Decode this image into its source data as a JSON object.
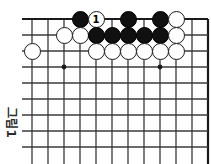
{
  "figure": {
    "caption": "그림1",
    "kind": "go-board-diagram"
  },
  "board": {
    "background_color": "#ffffff",
    "line_color": "#3a3a3a",
    "edge_color": "#1a1a1a",
    "columns": 12,
    "rows": 9,
    "spacing_px": 16,
    "origin_x": 32,
    "origin_y": 19,
    "right_edge_bold": true,
    "star_points": [
      {
        "col": 2,
        "row": 3
      },
      {
        "col": 8,
        "row": 3
      }
    ]
  },
  "stones": [
    {
      "id": "s1",
      "color": "black",
      "col": 3,
      "row": 0,
      "label": ""
    },
    {
      "id": "s2",
      "color": "white",
      "col": 4,
      "row": 0,
      "label": "1"
    },
    {
      "id": "s3",
      "color": "black",
      "col": 6,
      "row": 0,
      "label": ""
    },
    {
      "id": "s4",
      "color": "black",
      "col": 8,
      "row": 0,
      "label": ""
    },
    {
      "id": "s5",
      "color": "white",
      "col": 9,
      "row": 0,
      "label": ""
    },
    {
      "id": "s6",
      "color": "white",
      "col": 2,
      "row": 1,
      "label": ""
    },
    {
      "id": "s7",
      "color": "white",
      "col": 3,
      "row": 1,
      "label": ""
    },
    {
      "id": "s8",
      "color": "black",
      "col": 4,
      "row": 1,
      "label": ""
    },
    {
      "id": "s9",
      "color": "black",
      "col": 5,
      "row": 1,
      "label": ""
    },
    {
      "id": "s10",
      "color": "black",
      "col": 6,
      "row": 1,
      "label": ""
    },
    {
      "id": "s11",
      "color": "black",
      "col": 7,
      "row": 1,
      "label": ""
    },
    {
      "id": "s12",
      "color": "black",
      "col": 8,
      "row": 1,
      "label": ""
    },
    {
      "id": "s13",
      "color": "white",
      "col": 9,
      "row": 1,
      "label": ""
    },
    {
      "id": "s14",
      "color": "white",
      "col": 0,
      "row": 2,
      "label": ""
    },
    {
      "id": "s15",
      "color": "white",
      "col": 4,
      "row": 2,
      "label": ""
    },
    {
      "id": "s16",
      "color": "white",
      "col": 5,
      "row": 2,
      "label": ""
    },
    {
      "id": "s17",
      "color": "white",
      "col": 6,
      "row": 2,
      "label": ""
    },
    {
      "id": "s18",
      "color": "white",
      "col": 7,
      "row": 2,
      "label": ""
    },
    {
      "id": "s19",
      "color": "white",
      "col": 8,
      "row": 2,
      "label": ""
    },
    {
      "id": "s20",
      "color": "white",
      "col": 9,
      "row": 2,
      "label": ""
    }
  ]
}
